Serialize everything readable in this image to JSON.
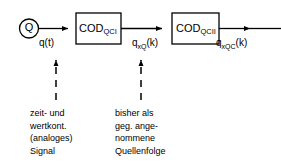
{
  "diagram": {
    "type": "block-diagram",
    "background_color": "#ffffff",
    "line_color": "#000000",
    "source": {
      "shape": "circle",
      "label": "Q",
      "name": "source-q"
    },
    "blocks": [
      {
        "id": "cod1",
        "base": "COD",
        "subscript": "QCI",
        "name": "cod-qci-block"
      },
      {
        "id": "cod2",
        "base": "COD",
        "subscript": "QCII",
        "name": "cod-qcii-block"
      }
    ],
    "signals": [
      {
        "id": "qt",
        "base": "q",
        "subscript": "",
        "suffix": "(t)",
        "text": "q(t)"
      },
      {
        "id": "qxq",
        "base": "q",
        "subscript": "xQ",
        "suffix": "(k)",
        "text": "qxQ(k)"
      },
      {
        "id": "qxqc",
        "base": "q",
        "subscript": "xQC",
        "suffix": "(k)",
        "text": "qxQC(k)"
      }
    ],
    "annotations": [
      {
        "id": "ann-left",
        "points_to": "qt",
        "line_style": "dashed",
        "arrow": "up",
        "lines": [
          "zeit- und",
          "wertkont.",
          "(analoges)",
          "Signal"
        ]
      },
      {
        "id": "ann-right",
        "points_to": "qxq",
        "line_style": "dashed",
        "arrow": "up",
        "lines": [
          "bisher als",
          "geg. ange-",
          "nommene",
          "Quellenfolge"
        ]
      }
    ]
  }
}
